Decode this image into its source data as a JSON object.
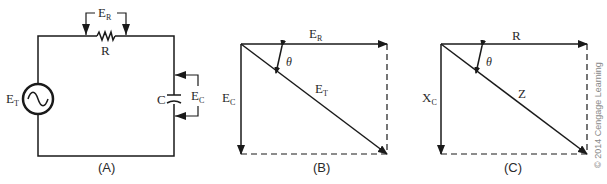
{
  "figure": {
    "panels": [
      {
        "id": "A",
        "caption": "(A)",
        "type": "series RC circuit",
        "labels": {
          "source": {
            "main": "E",
            "sub": "T"
          },
          "resistor_voltage": {
            "main": "E",
            "sub": "R"
          },
          "resistor": "R",
          "capacitor": "C",
          "capacitor_voltage": {
            "main": "E",
            "sub": "C"
          }
        }
      },
      {
        "id": "B",
        "caption": "(B)",
        "type": "voltage phasor diagram",
        "labels": {
          "horizontal": {
            "main": "E",
            "sub": "R"
          },
          "vertical": {
            "main": "E",
            "sub": "C"
          },
          "diagonal": {
            "main": "E",
            "sub": "T"
          },
          "angle": "θ"
        }
      },
      {
        "id": "C",
        "caption": "(C)",
        "type": "impedance phasor diagram",
        "labels": {
          "horizontal": "R",
          "vertical": {
            "main": "X",
            "sub": "C"
          },
          "diagonal": "Z",
          "angle": "θ"
        }
      }
    ],
    "copyright": "© 2014 Cengage Learning",
    "colors": {
      "line": "#1a1a1a",
      "text": "#2a2a2a",
      "copyright": "#8a8a8a",
      "background": "#ffffff"
    }
  }
}
